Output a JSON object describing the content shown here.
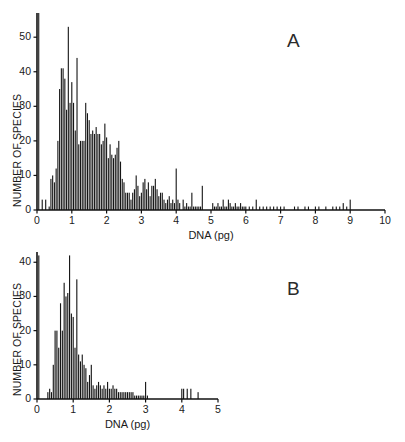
{
  "figure": {
    "background": "#ffffff",
    "ink_color": "#151515"
  },
  "panels": [
    {
      "letter": "A",
      "xlabel": "DNA (pg)",
      "ylabel": "NUMBER OF SPECIES",
      "x_ticks": [
        "0",
        "1",
        "2",
        "3",
        "4",
        "5",
        "6",
        "7",
        "8",
        "9",
        "10"
      ],
      "y_ticks": [
        "0",
        "10",
        "20",
        "30",
        "40",
        "50"
      ]
    },
    {
      "letter": "B",
      "xlabel": "DNA (pg)",
      "ylabel": "NUMBER OF SPECIES",
      "x_ticks": [
        "0",
        "1",
        "2",
        "3",
        "4",
        "5"
      ],
      "y_ticks": [
        "0",
        "10",
        "20",
        "30",
        "40"
      ]
    }
  ],
  "chart_data": [
    {
      "type": "bar",
      "title": "A",
      "xlabel": "DNA (pg)",
      "ylabel": "NUMBER OF SPECIES",
      "xlim": [
        0,
        10
      ],
      "ylim": [
        0,
        57
      ],
      "xtick_values": [
        0,
        1,
        2,
        3,
        4,
        5,
        6,
        7,
        8,
        9,
        10
      ],
      "ytick_values": [
        0,
        10,
        20,
        30,
        40,
        50
      ],
      "grid": false,
      "legend": "none",
      "bin_width": 0.05,
      "x": [
        0.05,
        0.1,
        0.15,
        0.2,
        0.25,
        0.3,
        0.35,
        0.4,
        0.45,
        0.5,
        0.55,
        0.6,
        0.65,
        0.7,
        0.75,
        0.8,
        0.85,
        0.9,
        0.95,
        1.0,
        1.05,
        1.1,
        1.15,
        1.2,
        1.25,
        1.3,
        1.35,
        1.4,
        1.45,
        1.5,
        1.55,
        1.6,
        1.65,
        1.7,
        1.75,
        1.8,
        1.85,
        1.9,
        1.95,
        2.0,
        2.05,
        2.1,
        2.15,
        2.2,
        2.25,
        2.3,
        2.35,
        2.4,
        2.45,
        2.5,
        2.55,
        2.6,
        2.65,
        2.7,
        2.75,
        2.8,
        2.85,
        2.9,
        2.95,
        3.0,
        3.05,
        3.1,
        3.15,
        3.2,
        3.25,
        3.3,
        3.35,
        3.4,
        3.45,
        3.5,
        3.55,
        3.6,
        3.65,
        3.7,
        3.75,
        3.8,
        3.85,
        3.9,
        3.95,
        4.0,
        4.05,
        4.1,
        4.15,
        4.2,
        4.25,
        4.3,
        4.35,
        4.4,
        4.45,
        4.5,
        4.55,
        4.6,
        4.65,
        4.7,
        4.75,
        4.8,
        4.85,
        4.9,
        4.95,
        5.0,
        5.05,
        5.1,
        5.15,
        5.2,
        5.25,
        5.3,
        5.35,
        5.4,
        5.45,
        5.5,
        5.55,
        5.6,
        5.65,
        5.7,
        5.75,
        5.8,
        5.85,
        5.9,
        5.95,
        6.0,
        6.1,
        6.2,
        6.3,
        6.4,
        6.5,
        6.6,
        6.7,
        6.8,
        6.9,
        7.0,
        7.1,
        7.2,
        7.3,
        7.4,
        7.5,
        7.6,
        7.7,
        7.8,
        7.9,
        8.0,
        8.1,
        8.2,
        8.3,
        8.4,
        8.5,
        8.6,
        8.7,
        8.8,
        8.9,
        9.0,
        9.1,
        9.2,
        9.3,
        9.4,
        9.5,
        9.6,
        9.7,
        9.8,
        9.9,
        10.0
      ],
      "values": [
        57,
        0,
        3,
        0,
        3,
        0,
        1,
        9,
        10,
        8,
        12,
        20,
        35,
        41,
        41,
        38,
        29,
        53,
        31,
        37,
        31,
        23,
        44,
        19,
        20,
        20,
        20,
        31,
        28,
        26,
        22,
        23,
        22,
        24,
        22,
        22,
        19,
        20,
        25,
        21,
        15,
        19,
        16,
        15,
        16,
        18,
        20,
        14,
        9,
        8,
        5,
        5,
        5,
        3,
        5,
        6,
        10,
        7,
        4,
        5,
        8,
        9,
        6,
        8,
        4,
        7,
        7,
        9,
        6,
        4,
        5,
        5,
        3,
        2,
        3,
        4,
        2,
        3,
        2,
        12,
        3,
        2,
        0,
        3,
        1,
        2,
        1,
        1,
        5,
        1,
        1,
        1,
        1,
        1,
        7,
        0,
        0,
        0,
        0,
        0,
        2,
        1,
        1,
        2,
        1,
        1,
        3,
        1,
        1,
        3,
        2,
        1,
        1,
        2,
        1,
        1,
        2,
        1,
        1,
        1,
        1,
        1,
        3,
        1,
        1,
        1,
        1,
        1,
        1,
        1,
        1,
        0,
        0,
        1,
        1,
        0,
        1,
        1,
        0,
        1,
        1,
        0,
        1,
        0,
        1,
        1,
        1,
        2,
        1,
        3
      ],
      "notes": "Histogram of genome size (DNA content, pg) frequency distribution; strong right skew with mode near 0.9-1.2 pg and a long sparse tail to 10 pg."
    },
    {
      "type": "bar",
      "title": "B",
      "xlabel": "DNA (pg)",
      "ylabel": "NUMBER OF SPECIES",
      "xlim": [
        0,
        5
      ],
      "ylim": [
        0,
        43
      ],
      "xtick_values": [
        0,
        1,
        2,
        3,
        4,
        5
      ],
      "ytick_values": [
        0,
        10,
        20,
        30,
        40
      ],
      "grid": false,
      "legend": "none",
      "bin_width": 0.05,
      "x": [
        0.05,
        0.1,
        0.15,
        0.2,
        0.25,
        0.3,
        0.35,
        0.4,
        0.45,
        0.5,
        0.55,
        0.6,
        0.65,
        0.7,
        0.75,
        0.8,
        0.85,
        0.9,
        0.95,
        1.0,
        1.05,
        1.1,
        1.15,
        1.2,
        1.25,
        1.3,
        1.35,
        1.4,
        1.45,
        1.5,
        1.55,
        1.6,
        1.65,
        1.7,
        1.75,
        1.8,
        1.85,
        1.9,
        1.95,
        2.0,
        2.05,
        2.1,
        2.15,
        2.2,
        2.25,
        2.3,
        2.35,
        2.4,
        2.45,
        2.5,
        2.55,
        2.6,
        2.65,
        2.7,
        2.75,
        2.8,
        2.85,
        2.9,
        2.95,
        3.0,
        3.05,
        3.1,
        3.2,
        3.4,
        3.6,
        3.8,
        4.0,
        4.05,
        4.15,
        4.25,
        4.35,
        4.45,
        4.55,
        4.65,
        4.75,
        4.85,
        5.0
      ],
      "values": [
        42,
        0,
        0,
        0,
        0,
        2,
        3,
        2,
        10,
        20,
        20,
        15,
        28,
        20,
        34,
        30,
        31,
        42,
        25,
        24,
        15,
        35,
        13,
        11,
        13,
        10,
        9,
        5,
        7,
        10,
        4,
        3,
        4,
        5,
        4,
        3,
        4,
        3,
        5,
        3,
        3,
        4,
        3,
        3,
        2,
        2,
        2,
        2,
        2,
        2,
        2,
        2,
        2,
        1,
        1,
        1,
        1,
        1,
        1,
        5,
        1,
        0,
        0,
        0,
        0,
        0,
        3,
        3,
        3,
        3,
        0,
        2,
        0,
        0,
        0,
        0,
        0
      ],
      "notes": "Histogram of genome size (DNA content, pg); narrower right-skewed distribution with mode near 0.9-1.15 pg, bulk below 2 pg and a short tail to about 4.6 pg."
    }
  ]
}
